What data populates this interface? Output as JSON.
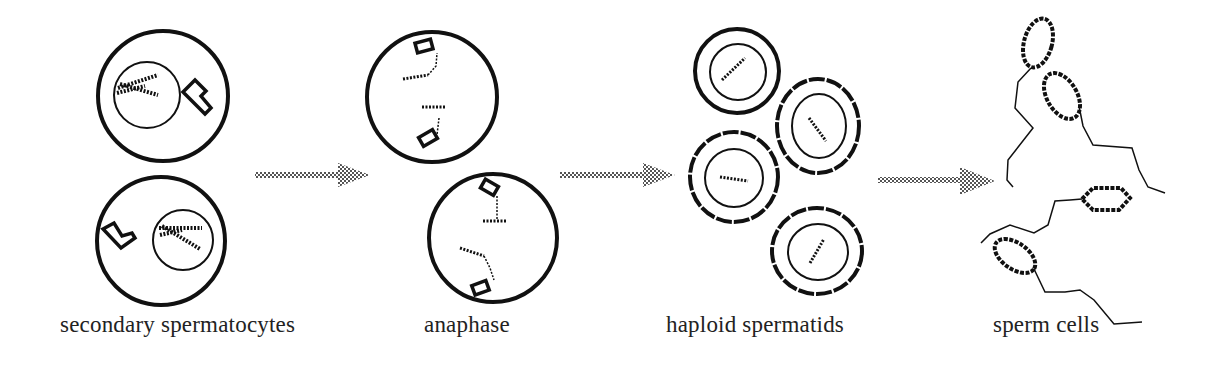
{
  "diagram": {
    "stages": [
      {
        "id": "secondary-spermatocytes",
        "label": "secondary spermatocytes"
      },
      {
        "id": "anaphase",
        "label": "anaphase"
      },
      {
        "id": "haploid-spermatids",
        "label": "haploid spermatids"
      },
      {
        "id": "sperm-cells",
        "label": "sperm cells"
      }
    ],
    "arrows": [
      {
        "from": "secondary-spermatocytes",
        "to": "anaphase",
        "icon": "stippled-arrow-right-icon"
      },
      {
        "from": "anaphase",
        "to": "haploid-spermatids",
        "icon": "stippled-arrow-right-icon"
      },
      {
        "from": "haploid-spermatids",
        "to": "sperm-cells",
        "icon": "stippled-arrow-right-icon"
      }
    ],
    "colors": {
      "line": "#111111",
      "arrow_fill": "#777777",
      "label_text": "#222222",
      "background": "#ffffff"
    }
  }
}
